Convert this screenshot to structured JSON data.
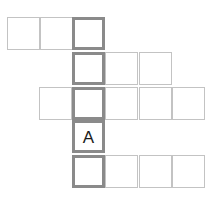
{
  "diagram": {
    "type": "polyomino-net",
    "geometry": {
      "cell_size": 33,
      "origin_x": 7,
      "origin_y": 17,
      "canvas_width": 211,
      "canvas_height": 197
    },
    "colors": {
      "light_border": "#c3c3c3",
      "bold_border": "#8a8a8a",
      "cell_fill": "#ffffff",
      "background": "#ffffff",
      "label_color": "#1a1a1a"
    },
    "rows": [
      {
        "row_index": 0,
        "y": 17,
        "cells": [
          {
            "col": 0,
            "x": 7,
            "style": "light",
            "label": ""
          },
          {
            "col": 1,
            "x": 40,
            "style": "light",
            "label": ""
          },
          {
            "col": 2,
            "x": 72,
            "style": "bold",
            "label": ""
          }
        ]
      },
      {
        "row_index": 1,
        "y": 52,
        "cells": [
          {
            "col": 2,
            "x": 72,
            "style": "bold",
            "label": ""
          },
          {
            "col": 3,
            "x": 105,
            "style": "light",
            "label": ""
          },
          {
            "col": 4,
            "x": 139,
            "style": "light",
            "label": ""
          }
        ]
      },
      {
        "row_index": 2,
        "y": 87,
        "cells": [
          {
            "col": 1,
            "x": 39,
            "style": "light",
            "label": ""
          },
          {
            "col": 2,
            "x": 72,
            "style": "bold",
            "label": ""
          },
          {
            "col": 3,
            "x": 105,
            "style": "light",
            "label": ""
          },
          {
            "col": 4,
            "x": 139,
            "style": "light",
            "label": ""
          },
          {
            "col": 5,
            "x": 172,
            "style": "light",
            "label": ""
          }
        ]
      },
      {
        "row_index": 3,
        "y": 120,
        "cells": [
          {
            "col": 2,
            "x": 72,
            "style": "bold",
            "label": "A"
          }
        ]
      },
      {
        "row_index": 4,
        "y": 155,
        "cells": [
          {
            "col": 2,
            "x": 72,
            "style": "bold",
            "label": ""
          },
          {
            "col": 3,
            "x": 105,
            "style": "light",
            "label": ""
          },
          {
            "col": 4,
            "x": 139,
            "style": "light",
            "label": ""
          },
          {
            "col": 5,
            "x": 172,
            "style": "light",
            "label": ""
          }
        ]
      }
    ]
  }
}
